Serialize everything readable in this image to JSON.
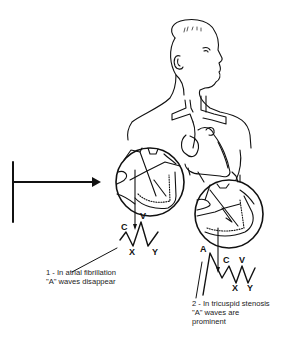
{
  "diagram": {
    "colors": {
      "line": "#111111",
      "background": "#ffffff"
    },
    "waveform_1": {
      "labels": {
        "c": "C",
        "v": "V",
        "x": "X",
        "y": "Y"
      },
      "caption_line1": "1 - In atrial fibrillation",
      "caption_line2": "\"A\" waves disappear"
    },
    "waveform_2": {
      "labels": {
        "a": "A",
        "c": "C",
        "v": "V",
        "x": "X",
        "y": "Y"
      },
      "caption_line1": "2 - In tricuspid stenosis",
      "caption_line2": "\"A\" waves are",
      "caption_line3": "prominent"
    }
  }
}
